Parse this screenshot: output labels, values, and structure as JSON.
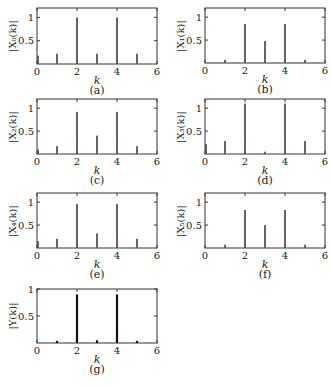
{
  "chart_data": [
    {
      "type": "bar",
      "id": "a",
      "caption": "(a)",
      "ylabel": "|X₀(k)|",
      "xlabel": "k",
      "x": [
        0,
        1,
        2,
        3,
        4,
        5
      ],
      "values": [
        0.18,
        0.22,
        1.0,
        0.22,
        1.0,
        0.22
      ],
      "xlim": [
        0,
        6
      ],
      "ylim": [
        0,
        1.2
      ],
      "xticks": [
        0,
        2,
        4,
        6
      ],
      "yticks": [
        0.5,
        1
      ],
      "ytick_labels": [
        "0.5",
        "1"
      ],
      "grid": false
    },
    {
      "type": "bar",
      "id": "b",
      "caption": "(b)",
      "ylabel": "|X₁(k)|",
      "xlabel": "k",
      "x": [
        0,
        1,
        2,
        3,
        4,
        5
      ],
      "values": [
        0.0,
        0.07,
        0.85,
        0.48,
        0.85,
        0.07
      ],
      "xlim": [
        0,
        6
      ],
      "ylim": [
        0,
        1.2
      ],
      "xticks": [
        0,
        2,
        4,
        6
      ],
      "yticks": [
        0.5,
        1
      ],
      "ytick_labels": [
        "0.5",
        "1"
      ],
      "grid": false
    },
    {
      "type": "bar",
      "id": "c",
      "caption": "(c)",
      "ylabel": "|X₂(k)|",
      "xlabel": "k",
      "x": [
        0,
        1,
        2,
        3,
        4,
        5
      ],
      "values": [
        0.1,
        0.17,
        0.92,
        0.4,
        0.92,
        0.17
      ],
      "xlim": [
        0,
        6
      ],
      "ylim": [
        0,
        1.2
      ],
      "xticks": [
        0,
        2,
        4,
        6
      ],
      "yticks": [
        0.5,
        1
      ],
      "ytick_labels": [
        "0.5",
        "1"
      ],
      "grid": false
    },
    {
      "type": "bar",
      "id": "d",
      "caption": "(d)",
      "ylabel": "|X₃(k)|",
      "xlabel": "k",
      "x": [
        0,
        1,
        2,
        3,
        4,
        5
      ],
      "values": [
        0.22,
        0.28,
        1.1,
        0.05,
        1.1,
        0.28
      ],
      "xlim": [
        0,
        6
      ],
      "ylim": [
        0,
        1.2
      ],
      "xticks": [
        0,
        2,
        4,
        6
      ],
      "yticks": [
        0.5,
        1
      ],
      "ytick_labels": [
        "0.5",
        "1"
      ],
      "grid": false
    },
    {
      "type": "bar",
      "id": "e",
      "caption": "(e)",
      "ylabel": "|X₄(k)|",
      "xlabel": "k",
      "x": [
        0,
        1,
        2,
        3,
        4,
        5
      ],
      "values": [
        0.15,
        0.2,
        0.96,
        0.32,
        0.96,
        0.2
      ],
      "xlim": [
        0,
        6
      ],
      "ylim": [
        0,
        1.2
      ],
      "xticks": [
        0,
        2,
        4,
        6
      ],
      "yticks": [
        0.5,
        1
      ],
      "ytick_labels": [
        "0.5",
        "1"
      ],
      "grid": false
    },
    {
      "type": "bar",
      "id": "f",
      "caption": "(f)",
      "ylabel": "|X₅(k)|",
      "xlabel": "k",
      "x": [
        0,
        1,
        2,
        3,
        4,
        5
      ],
      "values": [
        0.0,
        0.07,
        0.83,
        0.5,
        0.83,
        0.07
      ],
      "xlim": [
        0,
        6
      ],
      "ylim": [
        0,
        1.2
      ],
      "xticks": [
        0,
        2,
        4,
        6
      ],
      "yticks": [
        0.5,
        1
      ],
      "ytick_labels": [
        "0.5",
        "1"
      ],
      "grid": false
    },
    {
      "type": "bar",
      "id": "g",
      "caption": "(g)",
      "ylabel": "|Y(k)|",
      "xlabel": "k",
      "x": [
        0,
        1,
        2,
        3,
        4,
        5
      ],
      "values": [
        0.0,
        0.04,
        0.9,
        0.05,
        0.9,
        0.04
      ],
      "xlim": [
        0,
        6
      ],
      "ylim": [
        0,
        1.0
      ],
      "xticks": [
        0,
        2,
        4,
        6
      ],
      "yticks": [
        0.5,
        1
      ],
      "ytick_labels": [
        "0.5",
        "1"
      ],
      "grid": false
    }
  ],
  "style": {
    "bar_color": "#555555",
    "bar_color_final": "#111111",
    "axis_color": "#333333"
  }
}
